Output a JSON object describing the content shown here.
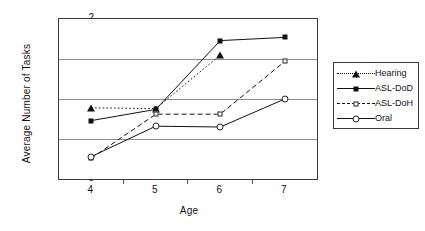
{
  "chart_data": {
    "type": "line",
    "title": "",
    "xlabel": "Age",
    "ylabel": "Average Number of Tasks",
    "categories": [
      "4",
      "5",
      "6",
      "7"
    ],
    "x": [
      4,
      5,
      6,
      7
    ],
    "xlim": [
      3.5,
      7.5
    ],
    "ylim": [
      0,
      2
    ],
    "yticks": [
      "0",
      "0.5",
      "1",
      "1.5",
      "2"
    ],
    "ytick_values": [
      0,
      0.5,
      1,
      1.5,
      2
    ],
    "grid": "horizontal",
    "legend_position": "right-outside",
    "series": [
      {
        "name": "Hearing",
        "marker": "triangle-filled",
        "line": "dotted",
        "values": [
          0.89,
          0.88,
          1.55,
          null
        ]
      },
      {
        "name": "ASL-DoD",
        "marker": "square-filled",
        "line": "solid",
        "values": [
          0.73,
          0.87,
          1.73,
          1.77
        ]
      },
      {
        "name": "ASL-DoH",
        "marker": "square-open",
        "line": "dashed",
        "values": [
          0.26,
          0.81,
          0.81,
          1.47
        ]
      },
      {
        "name": "Oral",
        "marker": "circle-open",
        "line": "solid",
        "values": [
          0.28,
          0.66,
          0.65,
          1.0
        ]
      }
    ]
  },
  "colors": {
    "axis": "#3a3a3a",
    "gridline": "#8c8c8c",
    "ink": "#111111",
    "background": "#ffffff"
  },
  "legend": {
    "items": [
      {
        "label": "Hearing"
      },
      {
        "label": "ASL-DoD"
      },
      {
        "label": "ASL-DoH"
      },
      {
        "label": "Oral"
      }
    ]
  }
}
